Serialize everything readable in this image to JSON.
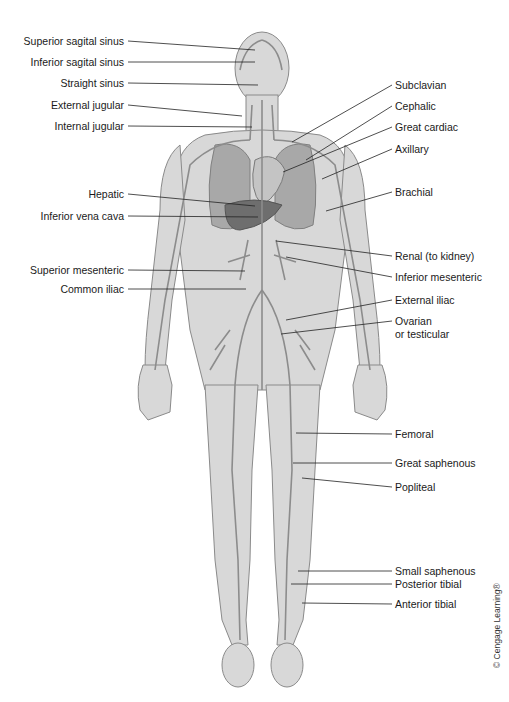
{
  "figure": {
    "colors": {
      "skin": "#d6d6d6",
      "skin_outline": "#8a8a8a",
      "vein": "#8c8c8c",
      "organ": "#9a9a9a",
      "liver": "#6e6e6e",
      "leader_line": "#222222",
      "text": "#1a1a1a"
    },
    "labels_left": [
      {
        "text": "Superior sagital sinus",
        "x": 128,
        "y": 41,
        "tx": 255,
        "ty": 50
      },
      {
        "text": "Inferior sagital sinus",
        "x": 128,
        "y": 62,
        "tx": 255,
        "ty": 62
      },
      {
        "text": "Straight sinus",
        "x": 128,
        "y": 83,
        "tx": 258,
        "ty": 85
      },
      {
        "text": "External jugular",
        "x": 128,
        "y": 105,
        "tx": 242,
        "ty": 116
      },
      {
        "text": "Internal jugular",
        "x": 128,
        "y": 126,
        "tx": 252,
        "ty": 127
      },
      {
        "text": "Hepatic",
        "x": 128,
        "y": 194,
        "tx": 255,
        "ty": 206
      },
      {
        "text": "Inferior vena cava",
        "x": 128,
        "y": 216,
        "tx": 258,
        "ty": 217
      },
      {
        "text": "Superior mesenteric",
        "x": 128,
        "y": 270,
        "tx": 245,
        "ty": 271
      },
      {
        "text": "Common iliac",
        "x": 128,
        "y": 289,
        "tx": 246,
        "ty": 289
      }
    ],
    "labels_right": [
      {
        "text": "Subclavian",
        "x": 392,
        "y": 85,
        "tx": 292,
        "ty": 142
      },
      {
        "text": "Cephalic",
        "x": 392,
        "y": 106,
        "tx": 306,
        "ty": 160
      },
      {
        "text": "Great cardiac",
        "x": 392,
        "y": 127,
        "tx": 283,
        "ty": 172
      },
      {
        "text": "Axillary",
        "x": 392,
        "y": 149,
        "tx": 322,
        "ty": 179
      },
      {
        "text": "Brachial",
        "x": 392,
        "y": 192,
        "tx": 326,
        "ty": 211
      },
      {
        "text": "Renal (to kidney)",
        "x": 392,
        "y": 256,
        "tx": 276,
        "ty": 241
      },
      {
        "text": "Inferior mesenteric",
        "x": 392,
        "y": 277,
        "tx": 286,
        "ty": 257
      },
      {
        "text": "External iliac",
        "x": 392,
        "y": 300,
        "tx": 286,
        "ty": 320
      },
      {
        "text": "Ovarian",
        "x": 392,
        "y": 321,
        "tx": 281,
        "ty": 334
      },
      {
        "text": "or testicular",
        "x": 392,
        "y": 334,
        "tx": null,
        "ty": null
      },
      {
        "text": "Femoral",
        "x": 392,
        "y": 434,
        "tx": 296,
        "ty": 433
      },
      {
        "text": "Great saphenous",
        "x": 392,
        "y": 463,
        "tx": 293,
        "ty": 463
      },
      {
        "text": "Popliteal",
        "x": 392,
        "y": 487,
        "tx": 302,
        "ty": 478
      },
      {
        "text": "Small saphenous",
        "x": 392,
        "y": 571,
        "tx": 298,
        "ty": 571
      },
      {
        "text": "Posterior tibial",
        "x": 392,
        "y": 584,
        "tx": 291,
        "ty": 584
      },
      {
        "text": "Anterior tibial",
        "x": 392,
        "y": 604,
        "tx": 302,
        "ty": 603
      }
    ],
    "copyright": "© Cengage Learning®"
  }
}
